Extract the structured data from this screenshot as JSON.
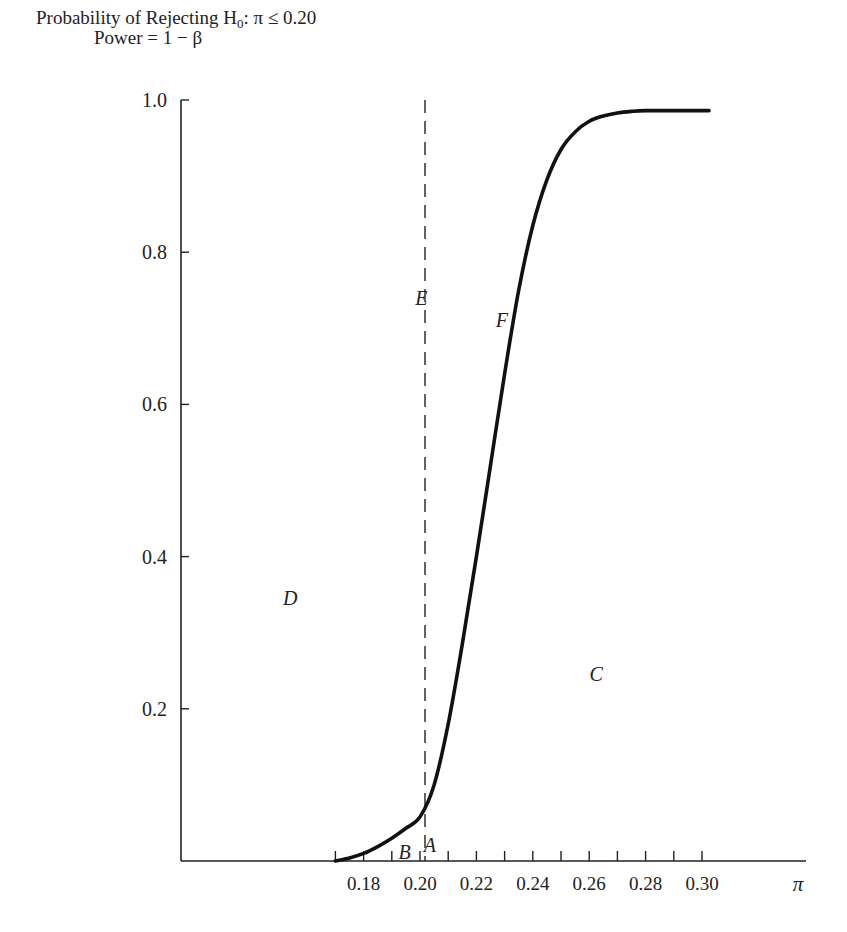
{
  "chart_data": {
    "type": "line",
    "title": "Probability of Rejecting H0: π ≤ 0.20",
    "title_parts": {
      "prefix": "Probability of Rejecting H",
      "subscript": "0",
      "suffix": ": π ≤ 0.20"
    },
    "subtitle": "Power = 1 − β",
    "xlabel": "π",
    "ylabel": "Probability of Rejecting H0 (Power = 1 − β)",
    "xlim": [
      0.15,
      0.335
    ],
    "ylim": [
      0,
      1.0
    ],
    "grid": false,
    "legend": "none",
    "x_ticks": [
      0.17,
      0.18,
      0.19,
      0.2,
      0.21,
      0.22,
      0.23,
      0.24,
      0.25,
      0.26,
      0.27,
      0.28,
      0.29,
      0.3
    ],
    "x_tick_labels": [
      "0.18",
      "0.20",
      "0.22",
      "0.24",
      "0.26",
      "0.28",
      "0.30"
    ],
    "x_tick_label_values": [
      0.18,
      0.2,
      0.22,
      0.24,
      0.26,
      0.28,
      0.3
    ],
    "y_tick_labels": [
      "0.2",
      "0.4",
      "0.6",
      "0.8",
      "1.0"
    ],
    "y_tick_values": [
      0.2,
      0.4,
      0.6,
      0.8,
      1.0
    ],
    "reference_line": {
      "x": 0.2,
      "style": "dashed",
      "label": "E"
    },
    "series": [
      {
        "name": "Power curve",
        "style": "solid-thick",
        "x": [
          0.17,
          0.175,
          0.18,
          0.185,
          0.19,
          0.195,
          0.2,
          0.205,
          0.21,
          0.215,
          0.22,
          0.225,
          0.23,
          0.235,
          0.24,
          0.245,
          0.25,
          0.255,
          0.26,
          0.265,
          0.27,
          0.275,
          0.28,
          0.29,
          0.3,
          0.3025
        ],
        "y": [
          0.0,
          0.004,
          0.01,
          0.019,
          0.03,
          0.043,
          0.058,
          0.1,
          0.18,
          0.285,
          0.4,
          0.52,
          0.64,
          0.75,
          0.835,
          0.895,
          0.935,
          0.958,
          0.972,
          0.979,
          0.983,
          0.985,
          0.986,
          0.986,
          0.986,
          0.986
        ]
      }
    ],
    "annotations": [
      {
        "text": "A",
        "x": 0.2035,
        "y": 0.012
      },
      {
        "text": "B",
        "x": 0.1945,
        "y": 0.002
      },
      {
        "text": "C",
        "x": 0.2625,
        "y": 0.237
      },
      {
        "text": "D",
        "x": 0.154,
        "y": 0.336
      },
      {
        "text": "E",
        "x": 0.2005,
        "y": 0.73
      },
      {
        "text": "F",
        "x": 0.229,
        "y": 0.702
      }
    ]
  }
}
